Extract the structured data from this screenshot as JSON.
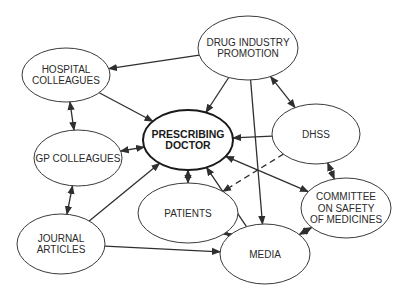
{
  "diagram": {
    "type": "influence network",
    "center_node": "prescribing_doctor",
    "nodes": {
      "drug_industry": {
        "lines": [
          "DRUG INDUSTRY",
          "PROMOTION"
        ],
        "cx": 248,
        "cy": 48,
        "rx": 50,
        "ry": 32
      },
      "hospital": {
        "lines": [
          "HOSPITAL",
          "COLLEAGUES"
        ],
        "cx": 66,
        "cy": 75,
        "rx": 44,
        "ry": 27
      },
      "prescribing_doctor": {
        "lines": [
          "PRESCRIBING",
          "DOCTOR"
        ],
        "cx": 188,
        "cy": 140,
        "rx": 45,
        "ry": 30,
        "bold": true
      },
      "dhss": {
        "lines": [
          "DHSS"
        ],
        "cx": 316,
        "cy": 134,
        "rx": 44,
        "ry": 30
      },
      "gp": {
        "lines": [
          "GP COLLEAGUES"
        ],
        "cx": 78,
        "cy": 158,
        "rx": 44,
        "ry": 28
      },
      "patients": {
        "lines": [
          "PATIENTS"
        ],
        "cx": 188,
        "cy": 213,
        "rx": 50,
        "ry": 30
      },
      "csm": {
        "lines": [
          "COMMITTEE",
          "ON SAFETY",
          "OF MEDICINES"
        ],
        "cx": 346,
        "cy": 208,
        "rx": 45,
        "ry": 30
      },
      "journal": {
        "lines": [
          "JOURNAL",
          "ARTICLES"
        ],
        "cx": 61,
        "cy": 244,
        "rx": 44,
        "ry": 30
      },
      "media": {
        "lines": [
          "MEDIA"
        ],
        "cx": 265,
        "cy": 254,
        "rx": 45,
        "ry": 30
      }
    },
    "edges": [
      {
        "from": "drug_industry",
        "to": "hospital",
        "direction": "forward",
        "style": "solid"
      },
      {
        "from": "drug_industry",
        "to": "prescribing_doctor",
        "direction": "forward",
        "style": "solid"
      },
      {
        "from": "drug_industry",
        "to": "dhss",
        "direction": "both",
        "style": "solid"
      },
      {
        "from": "drug_industry",
        "to": "media",
        "direction": "forward",
        "style": "solid"
      },
      {
        "from": "hospital",
        "to": "prescribing_doctor",
        "direction": "forward",
        "style": "solid"
      },
      {
        "from": "hospital",
        "to": "gp",
        "direction": "both",
        "style": "solid"
      },
      {
        "from": "gp",
        "to": "prescribing_doctor",
        "direction": "both",
        "style": "solid"
      },
      {
        "from": "gp",
        "to": "journal",
        "direction": "both",
        "style": "solid"
      },
      {
        "from": "dhss",
        "to": "prescribing_doctor",
        "direction": "forward",
        "style": "solid"
      },
      {
        "from": "dhss",
        "to": "patients",
        "direction": "forward",
        "style": "dashed"
      },
      {
        "from": "dhss",
        "to": "csm",
        "direction": "both",
        "style": "solid"
      },
      {
        "from": "prescribing_doctor",
        "to": "patients",
        "direction": "both",
        "style": "solid"
      },
      {
        "from": "prescribing_doctor",
        "to": "csm",
        "direction": "both",
        "style": "solid"
      },
      {
        "from": "media",
        "to": "prescribing_doctor",
        "direction": "forward",
        "style": "solid"
      },
      {
        "from": "journal",
        "to": "prescribing_doctor",
        "direction": "forward",
        "style": "solid"
      },
      {
        "from": "journal",
        "to": "media",
        "direction": "forward",
        "style": "solid"
      },
      {
        "from": "patients",
        "to": "media",
        "direction": "both",
        "style": "solid"
      },
      {
        "from": "csm",
        "to": "media",
        "direction": "both",
        "style": "solid"
      }
    ]
  }
}
